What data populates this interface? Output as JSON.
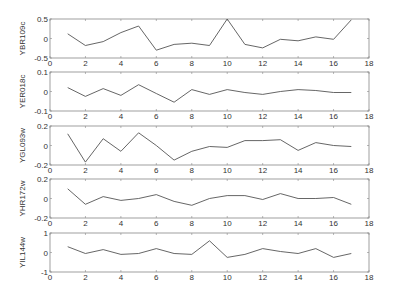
{
  "chart_data": [
    {
      "type": "line",
      "ylabel": "YBR109c",
      "ylim": [
        -0.5,
        0.5
      ],
      "yticks": [
        "0.5",
        "0",
        "-0.5"
      ],
      "xlim": [
        0,
        18
      ],
      "xticks": [
        "0",
        "2",
        "4",
        "6",
        "8",
        "10",
        "12",
        "14",
        "16",
        "18"
      ],
      "x": [
        1,
        2,
        3,
        4,
        5,
        6,
        7,
        8,
        9,
        10,
        11,
        12,
        13,
        14,
        15,
        16,
        17
      ],
      "values": [
        0.12,
        -0.18,
        -0.08,
        0.15,
        0.32,
        -0.3,
        -0.15,
        -0.12,
        -0.18,
        0.5,
        -0.15,
        -0.24,
        -0.02,
        -0.06,
        0.04,
        -0.02,
        0.48
      ]
    },
    {
      "type": "line",
      "ylabel": "YER018c",
      "ylim": [
        -0.1,
        0.1
      ],
      "yticks": [
        "0.1",
        "0",
        "-0.1"
      ],
      "xlim": [
        0,
        18
      ],
      "xticks": [
        "0",
        "2",
        "4",
        "6",
        "8",
        "10",
        "12",
        "14",
        "16",
        "18"
      ],
      "x": [
        1,
        2,
        3,
        4,
        5,
        6,
        7,
        8,
        9,
        10,
        11,
        12,
        13,
        14,
        15,
        16,
        17
      ],
      "values": [
        0.02,
        -0.025,
        0.015,
        -0.02,
        0.035,
        -0.01,
        -0.055,
        0.01,
        -0.015,
        0.01,
        -0.005,
        -0.015,
        0.0,
        0.01,
        0.005,
        -0.005,
        -0.005
      ]
    },
    {
      "type": "line",
      "ylabel": "YGL093w",
      "ylim": [
        -0.2,
        0.2
      ],
      "yticks": [
        "0.2",
        "0",
        "-0.2"
      ],
      "xlim": [
        0,
        18
      ],
      "xticks": [
        "0",
        "2",
        "4",
        "6",
        "8",
        "10",
        "12",
        "14",
        "16",
        "18"
      ],
      "x": [
        1,
        2,
        3,
        4,
        5,
        6,
        7,
        8,
        9,
        10,
        11,
        12,
        13,
        14,
        15,
        16,
        17
      ],
      "values": [
        0.12,
        -0.17,
        0.07,
        -0.06,
        0.13,
        0.0,
        -0.15,
        -0.06,
        -0.01,
        -0.02,
        0.05,
        0.05,
        0.06,
        -0.05,
        0.03,
        0.0,
        -0.01
      ]
    },
    {
      "type": "line",
      "ylabel": "YHR172w",
      "ylim": [
        -0.2,
        0.2
      ],
      "yticks": [
        "0.2",
        "0",
        "-0.2"
      ],
      "xlim": [
        0,
        18
      ],
      "xticks": [
        "0",
        "2",
        "4",
        "6",
        "8",
        "10",
        "12",
        "14",
        "16",
        "18"
      ],
      "x": [
        1,
        2,
        3,
        4,
        5,
        6,
        7,
        8,
        9,
        10,
        11,
        12,
        13,
        14,
        15,
        16,
        17
      ],
      "values": [
        0.1,
        -0.06,
        0.02,
        -0.02,
        0.0,
        0.04,
        -0.03,
        -0.07,
        0.0,
        0.03,
        0.03,
        -0.01,
        0.05,
        0.0,
        0.0,
        0.01,
        -0.06
      ]
    },
    {
      "type": "line",
      "ylabel": "YIL144w",
      "ylim": [
        -1,
        1
      ],
      "yticks": [
        "1",
        "0",
        "-1"
      ],
      "xlim": [
        0,
        18
      ],
      "xticks": [
        "0",
        "2",
        "4",
        "6",
        "8",
        "10",
        "12",
        "14",
        "16",
        "18"
      ],
      "x": [
        1,
        2,
        3,
        4,
        5,
        6,
        7,
        8,
        9,
        10,
        11,
        12,
        13,
        14,
        15,
        16,
        17
      ],
      "values": [
        0.3,
        -0.05,
        0.15,
        -0.1,
        -0.05,
        0.2,
        -0.05,
        -0.1,
        0.6,
        -0.25,
        -0.1,
        0.2,
        0.05,
        -0.05,
        0.2,
        -0.25,
        -0.05
      ]
    }
  ],
  "style": {
    "line_color": "#555555",
    "axis_color": "#888888",
    "text_color": "#333333"
  }
}
